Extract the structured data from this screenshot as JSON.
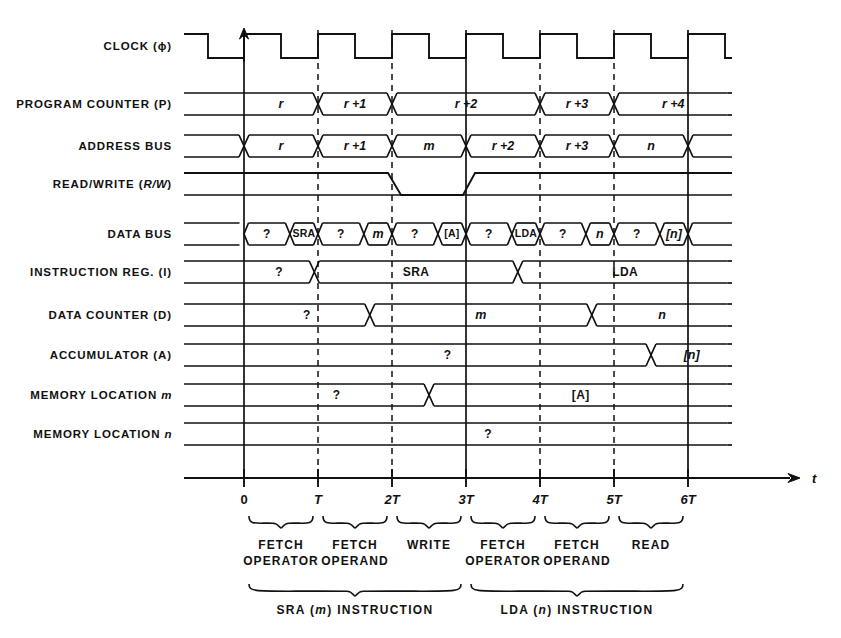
{
  "figure": {
    "type": "timing-diagram",
    "axis_label": "t",
    "time_ticks": [
      {
        "x_units": 0,
        "label": "0"
      },
      {
        "x_units": 1,
        "label": "T"
      },
      {
        "x_units": 2,
        "label": "2T"
      },
      {
        "x_units": 3,
        "label": "3T"
      },
      {
        "x_units": 4,
        "label": "4T"
      },
      {
        "x_units": 5,
        "label": "5T"
      },
      {
        "x_units": 6,
        "label": "6T"
      }
    ]
  },
  "signals": [
    {
      "name": "CLOCK (φ)",
      "label_html": "CLOCK (ϕ)"
    },
    {
      "name": "PROGRAM COUNTER (P)",
      "label_html": "PROGRAM COUNTER (P)"
    },
    {
      "name": "ADDRESS BUS",
      "label_html": "ADDRESS BUS"
    },
    {
      "name": "READ/WRITE (R/W)",
      "label_html": "READ/WRITE (<i>R/W</i>)"
    },
    {
      "name": "DATA BUS",
      "label_html": "DATA BUS"
    },
    {
      "name": "INSTRUCTION REG. (I)",
      "label_html": "INSTRUCTION REG. (I)"
    },
    {
      "name": "DATA COUNTER (D)",
      "label_html": "DATA COUNTER (D)"
    },
    {
      "name": "ACCUMULATOR (A)",
      "label_html": "ACCUMULATOR (A)"
    },
    {
      "name": "MEMORY LOCATION m",
      "label_html": "MEMORY LOCATION <i>m</i>"
    },
    {
      "name": "MEMORY LOCATION n",
      "label_html": "MEMORY LOCATION <i>n</i>"
    }
  ],
  "waveform_values": {
    "program_counter": [
      {
        "from": 0,
        "to": 1,
        "text": "r",
        "italic": true
      },
      {
        "from": 1,
        "to": 2,
        "text": "r +1",
        "italic": true
      },
      {
        "from": 2,
        "to": 4,
        "text": "r +2",
        "italic": true
      },
      {
        "from": 4,
        "to": 5,
        "text": "r +3",
        "italic": true
      },
      {
        "from": 5,
        "to": 6.6,
        "text": "r +4",
        "italic": true
      }
    ],
    "address_bus": [
      {
        "from": 0,
        "to": 1,
        "text": "r",
        "italic": true
      },
      {
        "from": 1,
        "to": 2,
        "text": "r +1",
        "italic": true
      },
      {
        "from": 2,
        "to": 3,
        "text": "m",
        "italic": true
      },
      {
        "from": 3,
        "to": 4,
        "text": "r +2",
        "italic": true
      },
      {
        "from": 4,
        "to": 5,
        "text": "r +3",
        "italic": true
      },
      {
        "from": 5,
        "to": 6,
        "text": "n",
        "italic": true
      }
    ],
    "read_write": {
      "low_from": 2,
      "low_to": 3,
      "description": "low during WRITE"
    },
    "data_bus": [
      {
        "from": 0,
        "to": 0.62,
        "text": "?",
        "italic": false
      },
      {
        "from": 0.62,
        "to": 1,
        "text": "SRA",
        "italic": false
      },
      {
        "from": 1,
        "to": 1.62,
        "text": "?",
        "italic": false
      },
      {
        "from": 1.62,
        "to": 2,
        "text": "m",
        "italic": true
      },
      {
        "from": 2,
        "to": 2.62,
        "text": "?",
        "italic": false
      },
      {
        "from": 2.62,
        "to": 3,
        "text": "[A]",
        "italic": false
      },
      {
        "from": 3,
        "to": 3.62,
        "text": "?",
        "italic": false
      },
      {
        "from": 3.62,
        "to": 4,
        "text": "LDA",
        "italic": false
      },
      {
        "from": 4,
        "to": 4.62,
        "text": "?",
        "italic": false
      },
      {
        "from": 4.62,
        "to": 5,
        "text": "n",
        "italic": true
      },
      {
        "from": 5,
        "to": 5.62,
        "text": "?",
        "italic": false
      },
      {
        "from": 5.62,
        "to": 6,
        "text": "[n]",
        "italic": true
      }
    ],
    "instruction_reg": [
      {
        "from": 0,
        "to": 0.95,
        "text": "?",
        "italic": false
      },
      {
        "from": 0.95,
        "to": 3.7,
        "text": "SRA",
        "italic": false
      },
      {
        "from": 3.7,
        "to": 6.6,
        "text": "LDA",
        "italic": false
      }
    ],
    "data_counter": [
      {
        "from": 0,
        "to": 1.7,
        "text": "?",
        "italic": false
      },
      {
        "from": 1.7,
        "to": 4.7,
        "text": "m",
        "italic": true
      },
      {
        "from": 4.7,
        "to": 6.6,
        "text": "n",
        "italic": true
      }
    ],
    "accumulator": [
      {
        "from": 0,
        "to": 5.5,
        "text": "?",
        "italic": false
      },
      {
        "from": 5.5,
        "to": 6.6,
        "text": "[n]",
        "italic": true
      }
    ],
    "memory_location_m": [
      {
        "from": 0,
        "to": 2.5,
        "text": "?",
        "italic": false
      },
      {
        "from": 2.5,
        "to": 6.6,
        "text": "[A]",
        "italic": false
      }
    ],
    "memory_location_n": [
      {
        "from": 0,
        "to": 6.6,
        "text": "?",
        "italic": false
      }
    ]
  },
  "phase_braces": [
    {
      "from": 0,
      "to": 1,
      "lines": [
        "FETCH",
        "OPERATOR"
      ]
    },
    {
      "from": 1,
      "to": 2,
      "lines": [
        "FETCH",
        "OPERAND"
      ]
    },
    {
      "from": 2,
      "to": 3,
      "lines": [
        "WRITE",
        ""
      ]
    },
    {
      "from": 3,
      "to": 4,
      "lines": [
        "FETCH",
        "OPERATOR"
      ]
    },
    {
      "from": 4,
      "to": 5,
      "lines": [
        "FETCH",
        "OPERAND"
      ]
    },
    {
      "from": 5,
      "to": 6,
      "lines": [
        "READ",
        ""
      ]
    }
  ],
  "instruction_braces": [
    {
      "from": 0,
      "to": 3,
      "label": "SRA (m) INSTRUCTION",
      "italic_part": "m"
    },
    {
      "from": 3,
      "to": 6,
      "label": "LDA (n) INSTRUCTION",
      "italic_part": "n"
    }
  ],
  "colors": {
    "ink": "#111111",
    "background": "#ffffff"
  }
}
